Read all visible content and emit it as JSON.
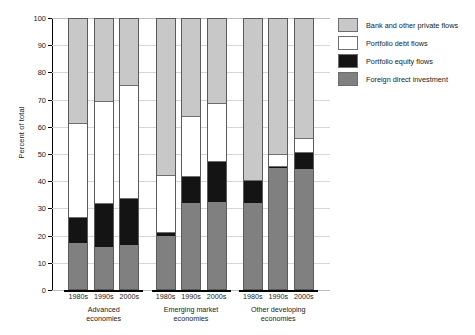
{
  "chart_data": {
    "type": "bar",
    "stacked": true,
    "title": "",
    "xlabel": "",
    "ylabel": "Percent of total",
    "ylim": [
      0,
      100
    ],
    "ytick_values": [
      0,
      10,
      20,
      30,
      40,
      50,
      60,
      70,
      80,
      90,
      100
    ],
    "ytick_labels": [
      "0",
      "10",
      "20",
      "30",
      "40",
      "50",
      "60",
      "70",
      "80",
      "90",
      "100"
    ],
    "grid": true,
    "legend_position": "right",
    "groups": [
      {
        "name": "Advanced\neconomies",
        "line1": "Advanced",
        "line2": "economies",
        "categories": [
          "1980s",
          "1990s",
          "2000s"
        ]
      },
      {
        "name": "Emerging market\neconomies",
        "line1": "Emerging market",
        "line2": "economies",
        "categories": [
          "1980s",
          "1990s",
          "2000s"
        ]
      },
      {
        "name": "Other developing\neconomies",
        "line1": "Other developing",
        "line2": "economies",
        "categories": [
          "1980s",
          "1990s",
          "2000s"
        ]
      }
    ],
    "categories": [
      "1980s",
      "1990s",
      "2000s",
      "1980s",
      "1990s",
      "2000s",
      "1980s",
      "1990s",
      "2000s"
    ],
    "series": [
      {
        "name": "Foreign direct investment",
        "color": "#808080",
        "values": [
          17.0,
          15.5,
          16.0,
          19.5,
          31.5,
          32.0,
          31.5,
          44.5,
          44.0
        ]
      },
      {
        "name": "Portfolio equity flows",
        "color": "#141414",
        "values": [
          9.5,
          16.0,
          17.5,
          1.5,
          10.0,
          15.0,
          8.5,
          0.8,
          6.5
        ]
      },
      {
        "name": "Portfolio debt flows",
        "color": "#ffffff",
        "values": [
          34.5,
          37.5,
          41.5,
          21.0,
          22.0,
          21.5,
          0.0,
          4.2,
          5.0
        ]
      },
      {
        "name": "Bank and other private flows",
        "color": "#c8c8c8",
        "values": [
          39.0,
          31.0,
          25.0,
          58.0,
          36.5,
          31.5,
          60.0,
          50.5,
          44.5
        ]
      }
    ],
    "legend": [
      {
        "label": "Bank and other private flows",
        "color": "#c8c8c8"
      },
      {
        "label": "Portfolio debt flows",
        "color": "#ffffff"
      },
      {
        "label": "Portfolio equity flows",
        "color": "#141414"
      },
      {
        "label": "Foreign direct investment",
        "color": "#808080"
      }
    ]
  }
}
